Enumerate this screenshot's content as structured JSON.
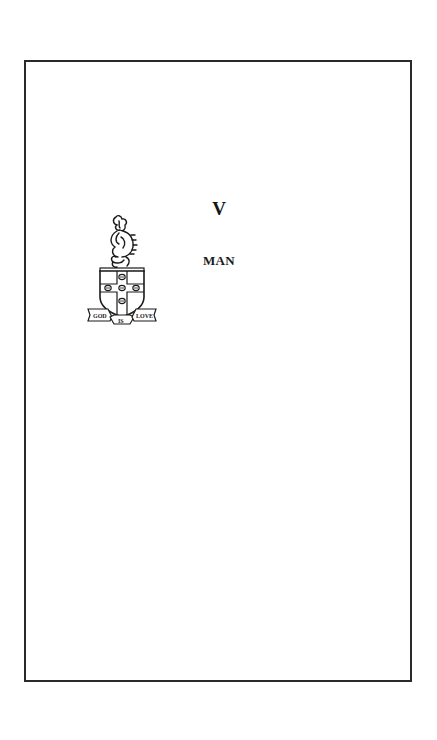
{
  "page": {
    "part_numeral": "V",
    "part_title": "MAN"
  },
  "crest": {
    "icon": "coat-of-arms-icon",
    "motto": {
      "left": "GOD",
      "center": "IS",
      "right": "LOVE"
    }
  },
  "colors": {
    "background": "#ffffff",
    "frame": "#2a2a2a",
    "ink": "#1a1a1a"
  }
}
